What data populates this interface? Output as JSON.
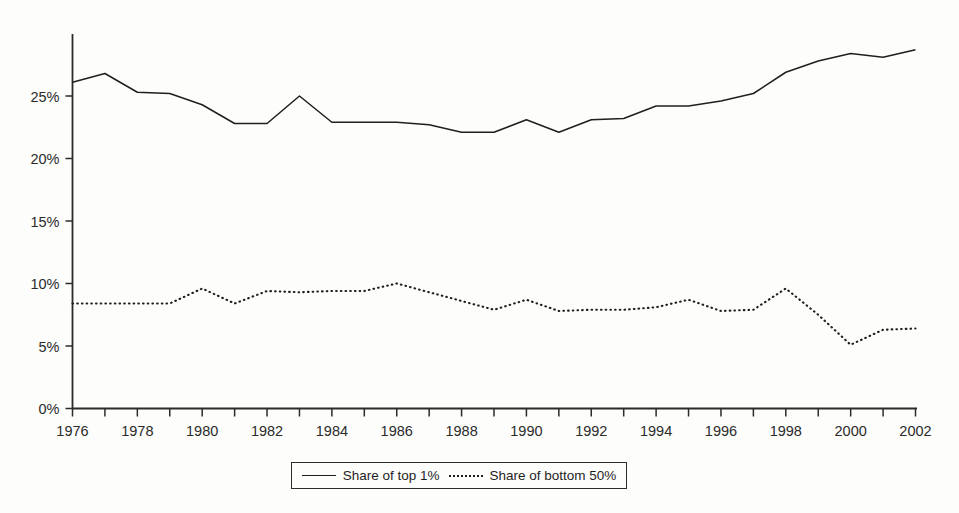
{
  "chart_data": {
    "type": "line",
    "title": "",
    "subtitle": "",
    "xlabel": "",
    "ylabel": "",
    "xlim": [
      1976,
      2002
    ],
    "ylim": [
      0,
      30
    ],
    "grid": false,
    "legend_position": "bottom-center",
    "x": [
      1976,
      1977,
      1978,
      1979,
      1980,
      1981,
      1982,
      1983,
      1984,
      1985,
      1986,
      1987,
      1988,
      1989,
      1990,
      1991,
      1992,
      1993,
      1994,
      1995,
      1996,
      1997,
      1998,
      1999,
      2000,
      2001,
      2002
    ],
    "series": [
      {
        "name": "Share of top 1%",
        "style": "solid",
        "values": [
          26.1,
          26.8,
          25.3,
          25.2,
          24.3,
          22.8,
          22.8,
          25.0,
          22.9,
          22.9,
          22.9,
          22.7,
          22.1,
          22.1,
          23.1,
          22.1,
          23.1,
          23.2,
          24.2,
          24.2,
          24.6,
          25.2,
          26.9,
          27.8,
          28.4,
          28.1,
          28.7
        ]
      },
      {
        "name": "Share of bottom 50%",
        "style": "dotted",
        "values": [
          8.4,
          8.4,
          8.4,
          8.4,
          9.6,
          8.4,
          9.4,
          9.3,
          9.4,
          9.4,
          10.0,
          9.3,
          8.6,
          7.9,
          8.7,
          7.8,
          7.9,
          7.9,
          8.1,
          8.7,
          7.8,
          7.9,
          9.6,
          7.5,
          5.1,
          6.3,
          6.4
        ]
      }
    ],
    "y_ticks": [
      0,
      5,
      10,
      15,
      20,
      25
    ],
    "y_tick_labels": [
      "0%",
      "5%",
      "10%",
      "15%",
      "20%",
      "25%"
    ],
    "x_ticks": [
      1976,
      1977,
      1978,
      1979,
      1980,
      1981,
      1982,
      1983,
      1984,
      1985,
      1986,
      1987,
      1988,
      1989,
      1990,
      1991,
      1992,
      1993,
      1994,
      1995,
      1996,
      1997,
      1998,
      1999,
      2000,
      2001,
      2002
    ],
    "x_tick_labels_shown": [
      "1976",
      "1978",
      "1980",
      "1982",
      "1984",
      "1986",
      "1988",
      "1990",
      "1992",
      "1994",
      "1996",
      "1998",
      "2000",
      "2002"
    ],
    "colors": {
      "line": "#1f1f1f",
      "axis": "#2b2b2b",
      "background": "#fdfdfb",
      "text": "#2b2b2b"
    }
  },
  "legend": {
    "entries": [
      {
        "label": "Share of top 1%",
        "style": "solid"
      },
      {
        "label": "Share of bottom 50%",
        "style": "dotted"
      }
    ]
  }
}
